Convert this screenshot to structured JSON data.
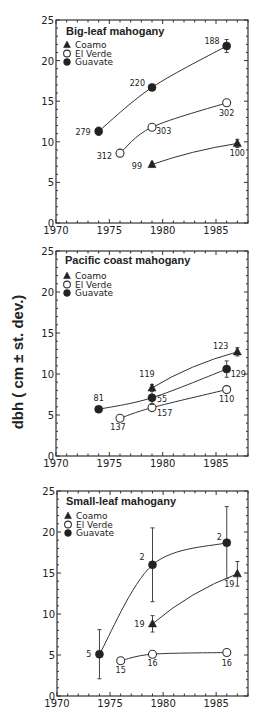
{
  "chart_data": {
    "ylabel": "dbh ( cm ± st. dev.)",
    "panels": [
      {
        "type": "line",
        "title": "Big-leaf mahogany",
        "xlim": [
          1970,
          1988
        ],
        "ylim": [
          0,
          25
        ],
        "xticks": [
          1970,
          1975,
          1980,
          1985
        ],
        "yticks": [
          0,
          5,
          10,
          15,
          20,
          25
        ],
        "legend": [
          "Coamo",
          "El Verde",
          "Guavate"
        ],
        "legend_position": "top-left",
        "series": [
          {
            "name": "Coamo",
            "marker": "triangle",
            "x": [
              1979,
              1987
            ],
            "y": [
              7.2,
              9.8
            ],
            "err": [
              0.3,
              0.5
            ],
            "labels": [
              "99",
              "100"
            ]
          },
          {
            "name": "El Verde",
            "marker": "open-circle",
            "x": [
              1976,
              1979,
              1986
            ],
            "y": [
              8.6,
              11.8,
              14.8
            ],
            "err": [
              0,
              0,
              0
            ],
            "labels": [
              "312",
              "303",
              "302"
            ]
          },
          {
            "name": "Guavate",
            "marker": "filled-circle",
            "x": [
              1974,
              1979,
              1986
            ],
            "y": [
              11.3,
              16.7,
              21.8
            ],
            "err": [
              0.5,
              0.3,
              0.8
            ],
            "labels": [
              "279",
              "220",
              "188"
            ]
          }
        ]
      },
      {
        "type": "line",
        "title": "Pacific coast mahogany",
        "xlim": [
          1970,
          1988
        ],
        "ylim": [
          0,
          25
        ],
        "xticks": [
          1970,
          1975,
          1980,
          1985
        ],
        "yticks": [
          0,
          5,
          10,
          15,
          20,
          25
        ],
        "legend": [
          "Coamo",
          "El Verde",
          "Guavate"
        ],
        "legend_position": "top-left",
        "series": [
          {
            "name": "Coamo",
            "marker": "triangle",
            "x": [
              1979,
              1987
            ],
            "y": [
              8.3,
              12.7
            ],
            "err": [
              0.4,
              0.5
            ],
            "labels": [
              "119",
              "123"
            ]
          },
          {
            "name": "El Verde",
            "marker": "open-circle",
            "x": [
              1976,
              1979,
              1986
            ],
            "y": [
              4.6,
              5.9,
              8.1
            ],
            "err": [
              0,
              0.3,
              0
            ],
            "labels": [
              "137",
              "157",
              "110"
            ]
          },
          {
            "name": "Guavate",
            "marker": "filled-circle",
            "x": [
              1974,
              1979,
              1986
            ],
            "y": [
              5.7,
              7.1,
              10.6
            ],
            "err": [
              0,
              0.8,
              1.0
            ],
            "labels": [
              "81",
              "55",
              "129"
            ]
          }
        ]
      },
      {
        "type": "line",
        "title": "Small-leaf mahogany",
        "xlim": [
          1970,
          1988
        ],
        "ylim": [
          0,
          25
        ],
        "xticks": [
          1970,
          1975,
          1980,
          1985
        ],
        "yticks": [
          0,
          5,
          10,
          15,
          20,
          25
        ],
        "legend": [
          "Coamo",
          "El Verde",
          "Guavate"
        ],
        "legend_position": "top-left",
        "series": [
          {
            "name": "Coamo",
            "marker": "triangle",
            "x": [
              1979,
              1987
            ],
            "y": [
              8.8,
              14.9
            ],
            "err": [
              1.0,
              1.5
            ],
            "labels": [
              "19",
              "19"
            ]
          },
          {
            "name": "El Verde",
            "marker": "open-circle",
            "x": [
              1976,
              1979,
              1986
            ],
            "y": [
              4.3,
              5.1,
              5.3
            ],
            "err": [
              0,
              0.2,
              0.2
            ],
            "labels": [
              "15",
              "16",
              "16"
            ]
          },
          {
            "name": "Guavate",
            "marker": "filled-circle",
            "x": [
              1974,
              1979,
              1986
            ],
            "y": [
              5.1,
              16.0,
              18.7
            ],
            "err": [
              3.0,
              4.5,
              4.4
            ],
            "labels": [
              "5",
              "2",
              "2"
            ]
          }
        ]
      }
    ]
  }
}
